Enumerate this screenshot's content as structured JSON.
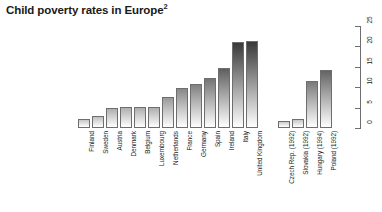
{
  "chart_data": {
    "type": "bar",
    "title": "Child poverty rates in Europe",
    "title_superscript": "2",
    "xlabel": "",
    "ylabel": "",
    "ylim": [
      0,
      25
    ],
    "yticks": [
      0,
      5,
      10,
      15,
      20,
      25
    ],
    "ytick_labels": [
      "0",
      "5",
      "10",
      "15",
      "20",
      "25"
    ],
    "grid": false,
    "legend": "none",
    "axis_position": "right",
    "categories": [
      "Finland",
      "Sweden",
      "Austria",
      "Denmark",
      "Belgium",
      "Luxembourg",
      "Netherlands",
      "France",
      "Germany",
      "Spain",
      "Ireland",
      "Italy",
      "United Kingdom",
      "Czech Rep. (1992)",
      "Slovakia (1992)",
      "Hungary (1994)",
      "Poland (1992)"
    ],
    "values": [
      2.2,
      3.0,
      5.0,
      5.1,
      5.2,
      5.2,
      7.7,
      9.8,
      10.7,
      12.3,
      14.8,
      21.2,
      21.3,
      1.8,
      2.2,
      11.6,
      14.2
    ],
    "group_gap_after_index": 12,
    "bar_style": {
      "edge_color": "#6e6e6e",
      "fill_top": "#3a3a3a",
      "fill_bottom": "#ffffff",
      "note": "vertical gradient fill, darker at top for taller bars"
    }
  },
  "colors": {
    "background": "#ffffff",
    "text": "#1a1a1a",
    "axis": "#6e6e6e"
  }
}
